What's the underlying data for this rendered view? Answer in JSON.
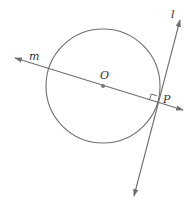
{
  "diagram": {
    "type": "geometry",
    "colors": {
      "stroke": "#6e6e6e",
      "point": "#7a7a7a",
      "label": "#333333",
      "background": "#ffffff"
    },
    "circle": {
      "center_label": "O",
      "cx": 103,
      "cy": 86,
      "r": 57
    },
    "labels": {
      "line_m": "m",
      "line_l": "l",
      "center": "O",
      "tangent_point": "P"
    },
    "points": {
      "O": {
        "x": 103,
        "y": 86
      },
      "P": {
        "x": 157,
        "y": 102
      }
    },
    "lines": {
      "m": {
        "x1": 15,
        "y1": 58,
        "x2": 183,
        "y2": 110
      },
      "l": {
        "x1": 180,
        "y1": 20,
        "x2": 134,
        "y2": 196
      }
    },
    "right_angle_marker_at": "P"
  }
}
